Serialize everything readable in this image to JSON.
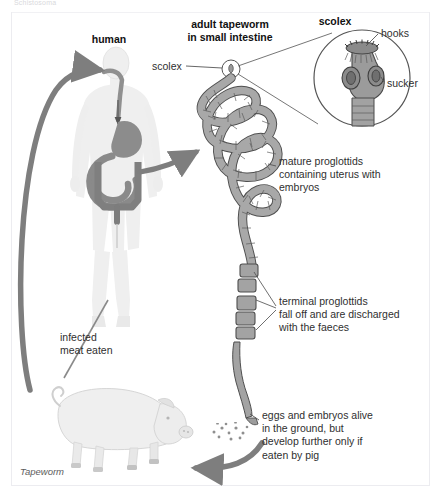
{
  "figure": {
    "clipped_header": "Schistosoma",
    "caption": "Tapeworm"
  },
  "labels": {
    "human": "human",
    "adult_tapeworm": "adult tapeworm\nin small intestine",
    "scolex_title": "scolex",
    "scolex_callout": "scolex",
    "hooks": "hooks",
    "sucker": "sucker",
    "mature_proglottids": "mature proglottids\ncontaining uterus with\nembryos",
    "terminal_proglottids": "terminal proglottids\nfall off and are discharged\nwith the faeces",
    "eggs": "eggs and embryos alive\nin the ground, but\ndevelop further only if\neaten by pig",
    "infected_meat": "infected\nmeat eaten"
  },
  "icons": {
    "human_silhouette": "human-body-icon",
    "pig": "pig-icon",
    "tapeworm": "tapeworm-icon",
    "scolex_inset": "scolex-magnifier-icon",
    "eggs": "eggs-icon",
    "arrow_to_mouth": "arrow-icon",
    "arrow_to_intestine": "arrow-icon",
    "arrow_to_pig": "arrow-icon",
    "arrow_pig_to_human": "arrow-icon"
  },
  "colors": {
    "background": "#ffffff",
    "body_fill": "#eeeeee",
    "organ_fill": "#8d8d8d",
    "worm_fill": "#a0a0a0",
    "worm_stroke": "#4d4d4d",
    "arrow_fill": "#808080",
    "text": "#2b2b2b",
    "caption_text": "#5d5d5d",
    "border": "#ececf0"
  }
}
